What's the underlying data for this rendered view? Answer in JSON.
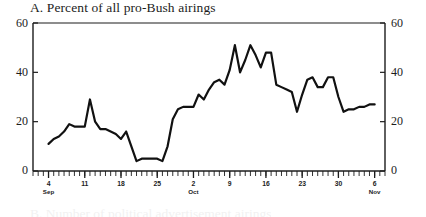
{
  "chart_data": {
    "type": "line",
    "title": "A. Percent of all pro-Bush airings",
    "xlabel": "",
    "ylabel": "",
    "ylim": [
      0,
      60
    ],
    "yticks": [
      0,
      20,
      40,
      60
    ],
    "ytick_labels_left": [
      "0",
      "20",
      "40",
      "60"
    ],
    "ytick_labels_right": [
      "0",
      "20",
      "40",
      "60"
    ],
    "grid": false,
    "legend": null,
    "axis_style": "box-frame, minor daily ticks on bottom axis, dual y-axes",
    "xlim_days": [
      0,
      68
    ],
    "xtick_labels": [
      {
        "day": "4",
        "month": "Sep",
        "index": 3
      },
      {
        "day": "11",
        "month": "",
        "index": 10
      },
      {
        "day": "18",
        "month": "",
        "index": 17
      },
      {
        "day": "25",
        "month": "",
        "index": 24
      },
      {
        "day": "2",
        "month": "Oct",
        "index": 31
      },
      {
        "day": "9",
        "month": "",
        "index": 38
      },
      {
        "day": "16",
        "month": "",
        "index": 45
      },
      {
        "day": "23",
        "month": "",
        "index": 52
      },
      {
        "day": "30",
        "month": "",
        "index": 59
      },
      {
        "day": "6",
        "month": "Nov",
        "index": 66
      }
    ],
    "series": [
      {
        "name": "Percent of all pro-Bush airings",
        "color": "#111111",
        "line_width": 2.2,
        "x": [
          3,
          4,
          5,
          6,
          7,
          8,
          9,
          10,
          11,
          12,
          13,
          14,
          15,
          16,
          17,
          18,
          19,
          20,
          21,
          22,
          23,
          24,
          25,
          26,
          27,
          28,
          29,
          30,
          31,
          32,
          33,
          34,
          35,
          36,
          37,
          38,
          39,
          40,
          41,
          42,
          43,
          44,
          45,
          46,
          47,
          48,
          49,
          50,
          51,
          52,
          53,
          54,
          55,
          56,
          57,
          58,
          59,
          60,
          61,
          62,
          63,
          64,
          65,
          66
        ],
        "values": [
          11,
          13,
          14,
          16,
          19,
          18,
          18,
          18,
          29,
          20,
          17,
          17,
          16,
          15,
          13,
          16,
          10,
          4,
          5,
          5,
          5,
          5,
          4,
          10,
          21,
          25,
          26,
          26,
          26,
          31,
          29,
          33,
          36,
          37,
          35,
          41,
          51,
          40,
          45,
          51,
          47,
          42,
          48,
          48,
          35,
          34,
          33,
          32,
          24,
          31,
          37,
          38,
          34,
          34,
          38,
          38,
          30,
          24,
          25,
          25,
          26,
          26,
          27,
          27
        ]
      }
    ]
  },
  "next_panel_preview": "B. Number of political advertisement airings"
}
